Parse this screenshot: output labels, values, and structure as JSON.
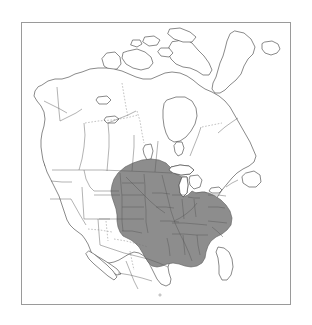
{
  "figure": {
    "type": "species-range-map",
    "region": "North America",
    "projection": "Lambert conformal conic",
    "caption": "",
    "background_color": "#ffffff",
    "frame_color": "#9a9a9a",
    "coastline_color": "#3a3a3a",
    "boundary_color": "#555555",
    "range_fill_color": "#8d8d8d",
    "range_stroke_color": "#5d5d5d",
    "water_color": "#ffffff"
  },
  "legend": {
    "present": false,
    "entries": [
      {
        "label": "Range",
        "swatch_color": "#8d8d8d"
      }
    ]
  },
  "map": {
    "title": "",
    "subtitle": "",
    "landmasses": [
      {
        "name": "Alaska",
        "shaded": false
      },
      {
        "name": "Canada",
        "shaded": "partial"
      },
      {
        "name": "Greenland",
        "shaded": false
      },
      {
        "name": "Iceland",
        "shaded": false
      },
      {
        "name": "Contiguous United States",
        "shaded": "partial"
      },
      {
        "name": "Mexico",
        "shaded": false
      },
      {
        "name": "Baja California",
        "shaded": false
      },
      {
        "name": "Newfoundland",
        "shaded": false
      },
      {
        "name": "Vancouver Island",
        "shaded": false
      }
    ],
    "water_bodies": [
      "Hudson Bay",
      "Great Lakes",
      "Gulf of Mexico",
      "Atlantic Ocean",
      "Pacific Ocean",
      "Arctic Ocean",
      "Baffin Bay",
      "Gulf of California"
    ],
    "range_description": "Shaded distribution covering the central and eastern United States and the southern Canadian prairie provinces; excludes peninsular Florida, the far western United States, Mexico, northern Canada and Alaska.",
    "boundary_styles": {
      "coastline": "solid thin",
      "state_province": "solid thin",
      "territorial": "dashed"
    }
  },
  "annotations": {
    "scale_bar": null,
    "north_arrow": null,
    "graticule": "dashed interior territorial lines only"
  }
}
